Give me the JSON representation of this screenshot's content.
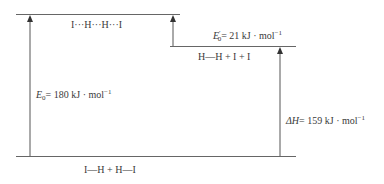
{
  "diagram": {
    "type": "energy-level-diagram",
    "levels": [
      {
        "id": "transition-state",
        "label": "I···H···H···I"
      },
      {
        "id": "intermediate",
        "label": "H—H + I + I"
      },
      {
        "id": "reactants",
        "label": "I—H + H—I"
      }
    ],
    "arrows": [
      {
        "id": "e0",
        "symbol": "E",
        "subscript": "0",
        "prime": "",
        "eq": "= 180 kJ · mol",
        "exp": "−1",
        "value": 180,
        "unit": "kJ·mol⁻¹"
      },
      {
        "id": "e0-prime",
        "symbol": "E",
        "subscript": "0",
        "prime": "′",
        "eq": "= 21 kJ · mol",
        "exp": "−1",
        "value": 21,
        "unit": "kJ·mol⁻¹"
      },
      {
        "id": "delta-h",
        "symbol": "ΔH",
        "subscript": "",
        "prime": "",
        "eq": "= 159 kJ · mol",
        "exp": "−1",
        "value": 159,
        "unit": "kJ·mol⁻¹"
      }
    ],
    "colors": {
      "line": "#555555",
      "text": "#3a3a3a"
    }
  }
}
